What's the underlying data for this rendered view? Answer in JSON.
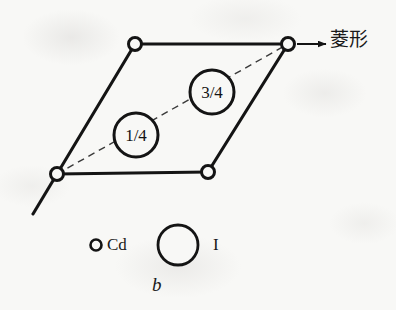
{
  "figure": {
    "caption": "b",
    "background_color": "#f8f8f6",
    "ink_color": "#141414"
  },
  "axis": {
    "arrow_label": "菱形",
    "arrow_icon": "right-arrow-icon"
  },
  "lattice": {
    "shape": "parallelogram",
    "vertices": [
      {
        "name": "top-left",
        "x": 135,
        "y": 44
      },
      {
        "name": "top-right",
        "x": 288,
        "y": 44
      },
      {
        "name": "bottom-right",
        "x": 208,
        "y": 172
      },
      {
        "name": "bottom-left",
        "x": 57,
        "y": 174
      }
    ],
    "vertex_atom": "Cd",
    "vertex_marker_radius": 6.5,
    "extension_line": {
      "x1": 57,
      "y1": 174,
      "x2": 33,
      "y2": 214
    },
    "diagonal": {
      "style": "dashed",
      "x1": 57,
      "y1": 174,
      "x2": 288,
      "y2": 44
    },
    "atoms": [
      {
        "label": "1/4",
        "cx": 136,
        "cy": 135,
        "r": 22,
        "element": "I"
      },
      {
        "label": "3/4",
        "cx": 212,
        "cy": 92,
        "r": 22,
        "element": "I"
      }
    ]
  },
  "legend": {
    "items": [
      {
        "symbol": "small-open-circle",
        "label": "Cd",
        "cx": 96,
        "cy": 245,
        "r": 5.5
      },
      {
        "symbol": "large-open-circle",
        "label": "I",
        "cx": 178,
        "cy": 245,
        "r": 20
      }
    ]
  }
}
